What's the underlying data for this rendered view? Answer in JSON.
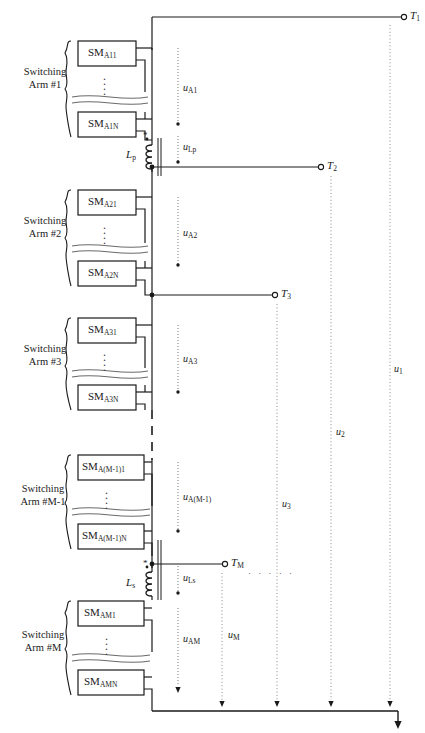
{
  "figure": {
    "type": "circuit-schematic"
  },
  "arms": [
    {
      "id": "arm1",
      "label_line1": "Switching",
      "label_line2": "Arm #1",
      "sm_top_prefix": "SM",
      "sm_top_sub": "A11",
      "sm_bottom_prefix": "SM",
      "sm_bottom_sub": "A1N",
      "arm_voltage_prefix": "u",
      "arm_voltage_sub": "A1"
    },
    {
      "id": "arm2",
      "label_line1": "Switching",
      "label_line2": "Arm #2",
      "sm_top_prefix": "SM",
      "sm_top_sub": "A21",
      "sm_bottom_prefix": "SM",
      "sm_bottom_sub": "A2N",
      "arm_voltage_prefix": "u",
      "arm_voltage_sub": "A2"
    },
    {
      "id": "arm3",
      "label_line1": "Switching",
      "label_line2": "Arm #3",
      "sm_top_prefix": "SM",
      "sm_top_sub": "A31",
      "sm_bottom_prefix": "SM",
      "sm_bottom_sub": "A3N",
      "arm_voltage_prefix": "u",
      "arm_voltage_sub": "A3"
    },
    {
      "id": "armM1",
      "label_line1": "Switching",
      "label_line2": "Arm #M-1",
      "sm_top_prefix": "SM",
      "sm_top_sub": "A(M-1)1",
      "sm_bottom_prefix": "SM",
      "sm_bottom_sub": "A(M-1)N",
      "arm_voltage_prefix": "u",
      "arm_voltage_sub": "A(M-1)"
    },
    {
      "id": "armM",
      "label_line1": "Switching",
      "label_line2": "Arm #M",
      "sm_top_prefix": "SM",
      "sm_top_sub": "AM1",
      "sm_bottom_prefix": "SM",
      "sm_bottom_sub": "AMN",
      "arm_voltage_prefix": "u",
      "arm_voltage_sub": "AM"
    }
  ],
  "inductors": [
    {
      "id": "lp",
      "name_prefix": "L",
      "name_sub": "p",
      "voltage_prefix": "u",
      "voltage_sub": "Lp",
      "polarity_marker": "*"
    },
    {
      "id": "ls",
      "name_prefix": "L",
      "name_sub": "s",
      "voltage_prefix": "u",
      "voltage_sub": "Ls",
      "polarity_marker": "*"
    }
  ],
  "terminals": [
    {
      "id": "t1",
      "prefix": "T",
      "sub": "1"
    },
    {
      "id": "t2",
      "prefix": "T",
      "sub": "2"
    },
    {
      "id": "t3",
      "prefix": "T",
      "sub": "3"
    },
    {
      "id": "tm",
      "prefix": "T",
      "sub": "M"
    }
  ],
  "terminal_voltages": [
    {
      "id": "u1",
      "prefix": "u",
      "sub": "1"
    },
    {
      "id": "u2",
      "prefix": "u",
      "sub": "2"
    },
    {
      "id": "u3",
      "prefix": "u",
      "sub": "3"
    },
    {
      "id": "um",
      "prefix": "u",
      "sub": "M"
    }
  ],
  "continuation": {
    "horizontal_dots": "· · · · ·",
    "vertical_dots": "⋮"
  },
  "colors": {
    "line": "#1a1a1a",
    "dotted": "#8a8a8a",
    "background": "#ffffff",
    "text": "#1a1a1a"
  }
}
